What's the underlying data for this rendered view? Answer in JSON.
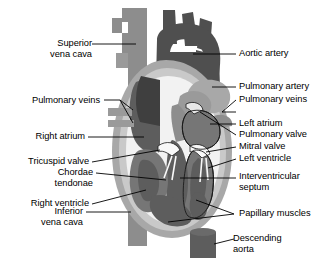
{
  "figure": {
    "background_color": "#ffffff",
    "text_color": "#000000",
    "width": 332,
    "height": 265
  },
  "palette": {
    "vein_gray": "#8d8d8d",
    "vein_gray_light": "#9a9a9a",
    "artery_dark": "#4f4f4f",
    "artery_darker": "#454545",
    "chamber_mid": "#767676",
    "chamber_dark": "#5d5d5d",
    "pulmonary_light": "#a8a8a8",
    "myocardium_light": "#c9c9c9",
    "cavity_white": "#f2f2f2",
    "outline": "#1a1a1a",
    "leader": "#000000"
  },
  "labels_left": [
    {
      "id": "superior-vena-cava",
      "text": "Superior\nvena cava"
    },
    {
      "id": "pulmonary-veins-left",
      "text": "Pulmonary veins"
    },
    {
      "id": "right-atrium",
      "text": "Right atrium"
    },
    {
      "id": "tricuspid-valve",
      "text": "Tricuspid valve"
    },
    {
      "id": "chordae-tendonae",
      "text": "Chordae\ntendonae"
    },
    {
      "id": "right-ventricle",
      "text": "Right ventricle"
    },
    {
      "id": "inferior-vena-cava",
      "text": "Inferior\nvena cava"
    }
  ],
  "labels_right": [
    {
      "id": "aortic-artery",
      "text": "Aortic artery"
    },
    {
      "id": "pulmonary-artery",
      "text": "Pulmonary artery"
    },
    {
      "id": "pulmonary-veins-right",
      "text": "Pulmonary veins"
    },
    {
      "id": "left-atrium",
      "text": "Left atrium"
    },
    {
      "id": "pulmonary-valve",
      "text": "Pulmonary valve"
    },
    {
      "id": "mitral-valve",
      "text": "Mitral valve"
    },
    {
      "id": "left-ventricle",
      "text": "Left ventricle"
    },
    {
      "id": "interventricular-septum",
      "text": "Interventricular\nseptum"
    },
    {
      "id": "papillary-muscles",
      "text": "Papillary muscles"
    },
    {
      "id": "descending-aorta",
      "text": "Descending\naorta"
    }
  ]
}
